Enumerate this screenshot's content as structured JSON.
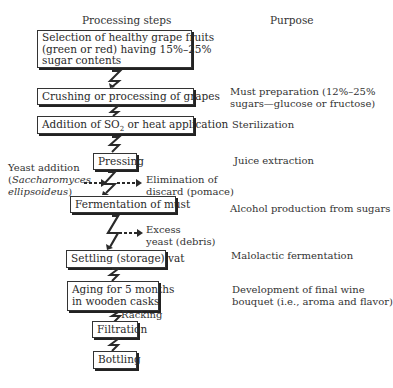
{
  "headers": {
    "steps": "Processing steps",
    "purpose": "Purpose"
  },
  "steps": [
    {
      "lines": [
        "Selection of healthy grape fruits",
        "(green or red) having 15%–25%",
        "sugar contents"
      ]
    },
    {
      "lines": [
        "Crushing or processing of grapes"
      ]
    },
    {
      "prefix": "Addition of SO",
      "sub": "2",
      "suffix": " or heat application"
    },
    {
      "lines": [
        "Pressing"
      ]
    },
    {
      "lines": [
        "Fermentation of must"
      ]
    },
    {
      "lines": [
        "Settling (storage) vat"
      ]
    },
    {
      "lines": [
        "Aging for 5 months",
        "in wooden casks"
      ]
    },
    {
      "lines": [
        "Filtration"
      ]
    },
    {
      "lines": [
        "Bottling"
      ]
    }
  ],
  "purposes": [
    {
      "lines": [
        "Must preparation (12%–25%",
        "sugars—glucose or fructose)"
      ]
    },
    {
      "lines": [
        "Sterilization"
      ]
    },
    {
      "lines": [
        "Juice extraction"
      ]
    },
    {
      "lines": [
        "Alcohol production from sugars"
      ]
    },
    {
      "lines": [
        "Malolactic fermentation"
      ]
    },
    {
      "lines": [
        "Development of final wine",
        "bouquet (i.e.,  aroma and flavor)"
      ]
    }
  ],
  "side_notes": {
    "yeast_addition": {
      "line1": "Yeast addition",
      "line2_open": "(",
      "line2_italic": "Saccharomyces",
      "line3_italic": "ellipsoideus",
      "line3_close": ")"
    },
    "pomace": {
      "line1": "Elimination of",
      "line2": "discard (pomace)"
    },
    "excess_yeast": {
      "line1": "Excess",
      "line2": "yeast (debris)"
    },
    "racking": "Racking"
  },
  "colors": {
    "line": "#2a2a2a",
    "shadow": "#222222",
    "background": "#ffffff"
  }
}
